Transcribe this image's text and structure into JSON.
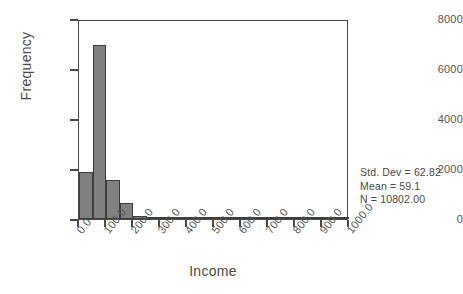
{
  "chart_data": {
    "type": "bar",
    "chart_style": "histogram",
    "title": "",
    "xlabel": "Income",
    "ylabel": "Frequency",
    "xlim": [
      0,
      1000
    ],
    "ylim": [
      0,
      8000
    ],
    "grid": false,
    "legend": null,
    "bin_width": 50,
    "bar_color": "#808080",
    "bar_edge_color": "#3d3d3d",
    "axis_color": "#4a4a4a",
    "x_tick_labels": [
      "0.0",
      "100.0",
      "200.0",
      "300.0",
      "400.0",
      "500.0",
      "600.0",
      "700.0",
      "800.0",
      "900.0",
      "1000.0"
    ],
    "x_tick_values": [
      0,
      100,
      200,
      300,
      400,
      500,
      600,
      700,
      800,
      900,
      1000
    ],
    "y_tick_labels": [
      "0",
      "2000",
      "4000",
      "6000",
      "8000"
    ],
    "y_tick_values": [
      0,
      2000,
      4000,
      6000,
      8000
    ],
    "bins": [
      {
        "x0": 0,
        "x1": 50,
        "value": 1870
      },
      {
        "x0": 50,
        "x1": 100,
        "value": 6960
      },
      {
        "x0": 100,
        "x1": 150,
        "value": 1580
      },
      {
        "x0": 150,
        "x1": 200,
        "value": 640
      },
      {
        "x0": 200,
        "x1": 250,
        "value": 120
      },
      {
        "x0": 250,
        "x1": 300,
        "value": 90
      },
      {
        "x0": 300,
        "x1": 350,
        "value": 50
      },
      {
        "x0": 350,
        "x1": 400,
        "value": 30
      },
      {
        "x0": 400,
        "x1": 450,
        "value": 15
      },
      {
        "x0": 450,
        "x1": 500,
        "value": 10
      },
      {
        "x0": 500,
        "x1": 550,
        "value": 8
      },
      {
        "x0": 550,
        "x1": 600,
        "value": 6
      },
      {
        "x0": 600,
        "x1": 650,
        "value": 5
      },
      {
        "x0": 650,
        "x1": 700,
        "value": 4
      },
      {
        "x0": 700,
        "x1": 750,
        "value": 3
      },
      {
        "x0": 750,
        "x1": 800,
        "value": 3
      },
      {
        "x0": 800,
        "x1": 850,
        "value": 2
      },
      {
        "x0": 850,
        "x1": 900,
        "value": 2
      },
      {
        "x0": 900,
        "x1": 950,
        "value": 2
      },
      {
        "x0": 950,
        "x1": 1000,
        "value": 2
      }
    ],
    "annotations": {
      "std_dev": "Std. Dev = 62.82",
      "mean": "Mean = 59.1",
      "n": "N = 10802.00"
    }
  }
}
